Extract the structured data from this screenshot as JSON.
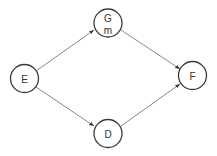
{
  "diagram": {
    "type": "directed-graph",
    "colors": {
      "node_stroke": "#3a3a3a",
      "edge": "#6a6a6a",
      "text": "#333333",
      "background": "#ffffff"
    },
    "nodes": [
      {
        "id": "E",
        "label": "E",
        "sublabel": ""
      },
      {
        "id": "G",
        "label": "G",
        "sublabel": "m"
      },
      {
        "id": "D",
        "label": "D",
        "sublabel": ""
      },
      {
        "id": "F",
        "label": "F",
        "sublabel": ""
      }
    ],
    "edges": [
      {
        "from": "E",
        "to": "G"
      },
      {
        "from": "E",
        "to": "D"
      },
      {
        "from": "G",
        "to": "F"
      },
      {
        "from": "D",
        "to": "F"
      }
    ]
  }
}
